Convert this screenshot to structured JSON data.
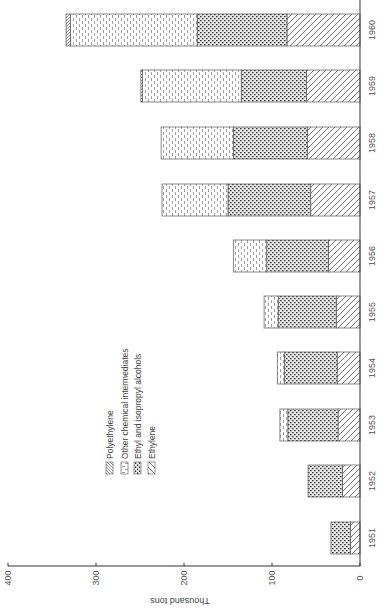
{
  "chart_data": {
    "type": "bar",
    "stacked": true,
    "orientation": "rotated (figure printed sideways; bars extend left from baseline at right)",
    "title": "",
    "xlabel": "",
    "ylabel": "Thousand tons",
    "ylim": [
      0,
      400
    ],
    "yticks": [
      0,
      100,
      200,
      300,
      400
    ],
    "categories": [
      "1951",
      "1952",
      "1953",
      "1954",
      "1955",
      "1956",
      "1957",
      "1958",
      "1959",
      "1960"
    ],
    "series": [
      {
        "name": "Ethylene",
        "pattern": "diagonal-hatch",
        "values": [
          11,
          20,
          25,
          26,
          27,
          36,
          56,
          60,
          61,
          83
        ]
      },
      {
        "name": "Ethyl and isopropyl alcohols",
        "pattern": "dense-dots",
        "values": [
          22,
          39,
          57,
          60,
          66,
          70,
          94,
          84,
          74,
          102
        ]
      },
      {
        "name": "Other chemical intermediates",
        "pattern": "dashes",
        "values": [
          0,
          0,
          9,
          8,
          16,
          38,
          75,
          82,
          112,
          144
        ]
      },
      {
        "name": "Polyethylene",
        "pattern": "fine-diagonal",
        "values": [
          0,
          0,
          0,
          0,
          0,
          0,
          0,
          0,
          2,
          5
        ]
      }
    ],
    "totals": [
      33,
      59,
      91,
      94,
      109,
      144,
      225,
      226,
      249,
      334
    ],
    "legend": {
      "position": "inside, upper-left of plot area (rotated)",
      "entries": [
        "Polyethylene",
        "Other chemical intermediates",
        "Ethyl and isopropyl alcohols",
        "Ethylene"
      ]
    },
    "grid": false
  },
  "axis": {
    "title": "Thousand tons",
    "ticks": [
      "0",
      "100",
      "200",
      "300",
      "400"
    ]
  },
  "legend": {
    "items": [
      {
        "label": "Polyethylene"
      },
      {
        "label": "Other chemical intermediates"
      },
      {
        "label": "Ethyl and isopropyl alcohols"
      },
      {
        "label": "Ethylene"
      }
    ]
  }
}
